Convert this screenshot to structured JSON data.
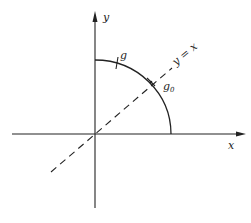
{
  "diagram": {
    "axes": {
      "x_label": "x",
      "y_label": "y"
    },
    "curve": {
      "type": "quarter-circle arc",
      "description": "arc in first quadrant from positive y-axis to positive x-axis"
    },
    "points": {
      "g_label": "g",
      "g0_label_main": "g",
      "g0_label_sub": "0"
    },
    "line": {
      "label": "y = x",
      "style": "dashed"
    },
    "colors": {
      "stroke": "#222222",
      "background": "#ffffff"
    }
  }
}
